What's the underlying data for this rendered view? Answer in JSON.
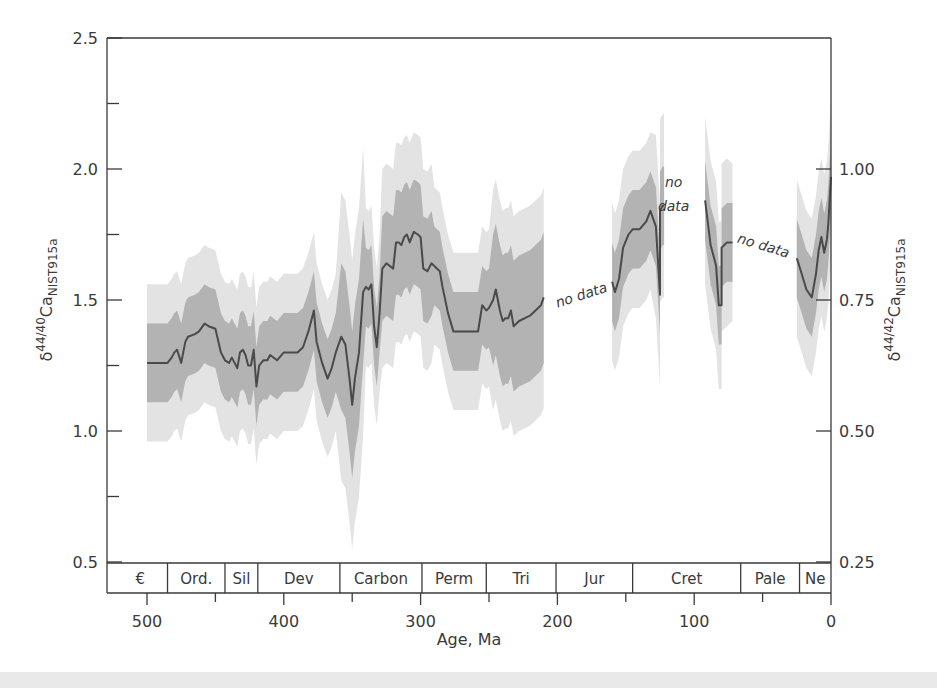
{
  "chart_data": {
    "type": "line",
    "title": "",
    "xlabel": "Age, Ma",
    "ylabel_left": "δ44/40Ca NIST915a",
    "ylabel_right": "δ44/42Ca NIST915a",
    "xlim": [
      525,
      0
    ],
    "ylim_left": [
      0.5,
      2.5
    ],
    "ylim_right": [
      0.25,
      1.25
    ],
    "x_ticks": [
      500,
      400,
      300,
      200,
      100,
      0
    ],
    "x_minor_ticks": [
      450,
      350,
      250,
      150,
      50
    ],
    "y_left_ticks": [
      0.5,
      1.0,
      1.5,
      2.0,
      2.5
    ],
    "y_left_minor_ticks": [
      0.75,
      1.25,
      1.75,
      2.25
    ],
    "y_right_ticks": [
      0.25,
      0.5,
      0.75,
      1.0
    ],
    "y_right_tick_labels": [
      "0.25",
      "0.50",
      "0.75",
      "1.00"
    ],
    "grid": false,
    "legend": null,
    "series": [
      {
        "name": "median",
        "segments": [
          {
            "x": [
              500,
              485,
              482,
              480,
              478,
              475,
              472,
              470,
              465,
              462,
              458,
              455,
              450,
              446,
              443,
              440,
              438,
              436,
              434,
              432,
              430,
              428,
              426,
              424,
              422,
              420,
              418,
              415,
              412,
              410,
              405,
              400,
              395,
              390,
              386,
              382,
              380,
              378,
              376,
              372,
              368,
              365,
              362,
              358,
              355,
              352,
              350,
              348,
              345,
              342,
              340,
              338,
              336,
              334,
              332,
              330,
              328,
              325,
              320,
              318,
              316,
              314,
              312,
              310,
              308,
              305,
              302,
              300,
              298,
              295,
              292,
              290,
              286,
              284,
              280,
              276,
              270,
              262,
              258,
              255,
              252,
              250,
              247,
              245,
              242,
              240,
              238,
              236,
              234,
              232,
              228,
              220,
              212,
              210
            ],
            "y": [
              1.26,
              1.26,
              1.28,
              1.3,
              1.31,
              1.26,
              1.34,
              1.36,
              1.37,
              1.38,
              1.41,
              1.4,
              1.39,
              1.3,
              1.27,
              1.26,
              1.28,
              1.26,
              1.24,
              1.3,
              1.31,
              1.29,
              1.25,
              1.25,
              1.31,
              1.17,
              1.25,
              1.27,
              1.27,
              1.29,
              1.27,
              1.3,
              1.3,
              1.3,
              1.32,
              1.38,
              1.42,
              1.46,
              1.34,
              1.26,
              1.2,
              1.24,
              1.3,
              1.36,
              1.33,
              1.2,
              1.1,
              1.2,
              1.3,
              1.53,
              1.55,
              1.54,
              1.56,
              1.4,
              1.32,
              1.45,
              1.62,
              1.64,
              1.62,
              1.72,
              1.72,
              1.71,
              1.74,
              1.75,
              1.72,
              1.76,
              1.75,
              1.74,
              1.62,
              1.61,
              1.64,
              1.63,
              1.61,
              1.55,
              1.45,
              1.38,
              1.38,
              1.38,
              1.38,
              1.48,
              1.46,
              1.47,
              1.5,
              1.54,
              1.46,
              1.42,
              1.43,
              1.43,
              1.46,
              1.4,
              1.42,
              1.44,
              1.48,
              1.51
            ]
          },
          {
            "x": [
              160,
              158,
              155,
              152,
              148,
              145,
              140,
              135,
              132,
              128,
              125,
              125,
              123,
              122
            ],
            "y": [
              1.57,
              1.53,
              1.58,
              1.7,
              1.75,
              1.77,
              1.77,
              1.8,
              1.84,
              1.78,
              1.52,
              1.84,
              1.86,
              1.86
            ]
          },
          {
            "x": [
              92,
              88,
              86,
              84,
              82,
              80,
              80,
              78,
              76,
              72
            ],
            "y": [
              1.88,
              1.71,
              1.67,
              1.63,
              1.48,
              1.48,
              1.7,
              1.71,
              1.72,
              1.72
            ]
          },
          {
            "x": [
              25,
              22,
              18,
              14,
              11,
              9,
              7,
              5,
              3,
              2,
              0
            ],
            "y": [
              1.66,
              1.61,
              1.54,
              1.51,
              1.6,
              1.69,
              1.74,
              1.68,
              1.73,
              1.79,
              1.97
            ]
          }
        ]
      },
      {
        "name": "inner_band_50pct",
        "description": "dark gray uncertainty envelope ~±0.15–0.3"
      },
      {
        "name": "outer_band_95pct",
        "description": "light gray uncertainty envelope ~±0.3–0.6"
      }
    ],
    "annotations": [
      {
        "text": "no data",
        "x_range": [
          210,
          160
        ],
        "y": 1.55,
        "rotated": true
      },
      {
        "text": "no",
        "x": 115,
        "y": 1.93
      },
      {
        "text": "data",
        "x": 115,
        "y": 1.84
      },
      {
        "text": "no data",
        "x_range": [
          72,
          25
        ],
        "y": 1.68,
        "rotated": true
      }
    ],
    "periods": [
      {
        "label": "€",
        "start": 525,
        "end": 485
      },
      {
        "label": "Ord.",
        "start": 485,
        "end": 443
      },
      {
        "label": "Sil",
        "start": 443,
        "end": 419
      },
      {
        "label": "Dev",
        "start": 419,
        "end": 359
      },
      {
        "label": "Carbon",
        "start": 359,
        "end": 299
      },
      {
        "label": "Perm",
        "start": 299,
        "end": 252
      },
      {
        "label": "Tri",
        "start": 252,
        "end": 201
      },
      {
        "label": "Jur",
        "start": 201,
        "end": 145
      },
      {
        "label": "Cret",
        "start": 145,
        "end": 66
      },
      {
        "label": "Pale",
        "start": 66,
        "end": 23
      },
      {
        "label": "Ne",
        "start": 23,
        "end": 0
      }
    ]
  },
  "labels": {
    "x_title": "Age, Ma",
    "y_left_main": "δ",
    "y_left_sup": "44/40",
    "y_left_ca": "Ca",
    "y_left_sub": "NIST915a",
    "y_right_main": "δ",
    "y_right_sup": "44/42",
    "y_right_ca": "Ca",
    "y_right_sub": "NIST915a"
  },
  "colors": {
    "line": "#4a4a4a",
    "inner_band": "#b3b3b3",
    "outer_band": "#e3e3e3",
    "axis": "#3a3a3a"
  }
}
